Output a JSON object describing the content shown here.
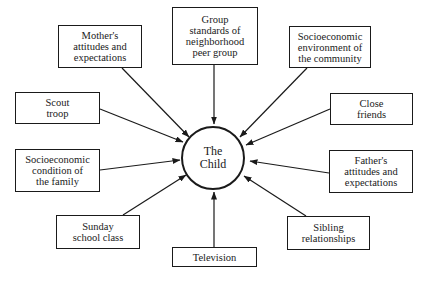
{
  "diagram": {
    "center": {
      "label": "The\nChild",
      "cx": 213,
      "cy": 158,
      "r": 31
    },
    "nodes": [
      {
        "id": "mother",
        "label": "Mother's\nattitudes and\nexpectations",
        "x": 58,
        "y": 25,
        "w": 84,
        "h": 43
      },
      {
        "id": "group-standards",
        "label": "Group\nstandards of\nneighborhood\npeer group",
        "x": 172,
        "y": 7,
        "w": 86,
        "h": 58
      },
      {
        "id": "community",
        "label": "Socioeconomic\nenvironment of\nthe community",
        "x": 289,
        "y": 26,
        "w": 82,
        "h": 42
      },
      {
        "id": "scout",
        "label": "Scout\ntroop",
        "x": 15,
        "y": 92,
        "w": 85,
        "h": 32
      },
      {
        "id": "close-friends",
        "label": "Close\nfriends",
        "x": 330,
        "y": 93,
        "w": 83,
        "h": 32
      },
      {
        "id": "family-condition",
        "label": "Socioeconomic\ncondition of\nthe family",
        "x": 15,
        "y": 149,
        "w": 85,
        "h": 43
      },
      {
        "id": "father",
        "label": "Father's\nattitudes and\nexpectations",
        "x": 329,
        "y": 150,
        "w": 84,
        "h": 43
      },
      {
        "id": "sunday-school",
        "label": "Sunday\nschool class",
        "x": 56,
        "y": 215,
        "w": 84,
        "h": 34
      },
      {
        "id": "sibling",
        "label": "Sibling\nrelationships",
        "x": 287,
        "y": 216,
        "w": 83,
        "h": 34
      },
      {
        "id": "television",
        "label": "Television",
        "x": 172,
        "y": 247,
        "w": 85,
        "h": 20
      }
    ],
    "arrows": [
      {
        "from": "mother",
        "x1": 122,
        "y1": 68,
        "x2": 189,
        "y2": 137
      },
      {
        "from": "group-standards",
        "x1": 214,
        "y1": 65,
        "x2": 214,
        "y2": 124
      },
      {
        "from": "community",
        "x1": 307,
        "y1": 68,
        "x2": 240,
        "y2": 137
      },
      {
        "from": "scout",
        "x1": 100,
        "y1": 109,
        "x2": 183,
        "y2": 142
      },
      {
        "from": "close-friends",
        "x1": 330,
        "y1": 109,
        "x2": 246,
        "y2": 145
      },
      {
        "from": "family-condition",
        "x1": 100,
        "y1": 170,
        "x2": 180,
        "y2": 160
      },
      {
        "from": "father",
        "x1": 329,
        "y1": 173,
        "x2": 250,
        "y2": 161
      },
      {
        "from": "sunday-school",
        "x1": 123,
        "y1": 215,
        "x2": 186,
        "y2": 175
      },
      {
        "from": "sibling",
        "x1": 306,
        "y1": 216,
        "x2": 244,
        "y2": 176
      },
      {
        "from": "television",
        "x1": 214,
        "y1": 247,
        "x2": 214,
        "y2": 192
      }
    ],
    "colors": {
      "stroke": "#1a1a1a",
      "background": "#ffffff"
    }
  }
}
